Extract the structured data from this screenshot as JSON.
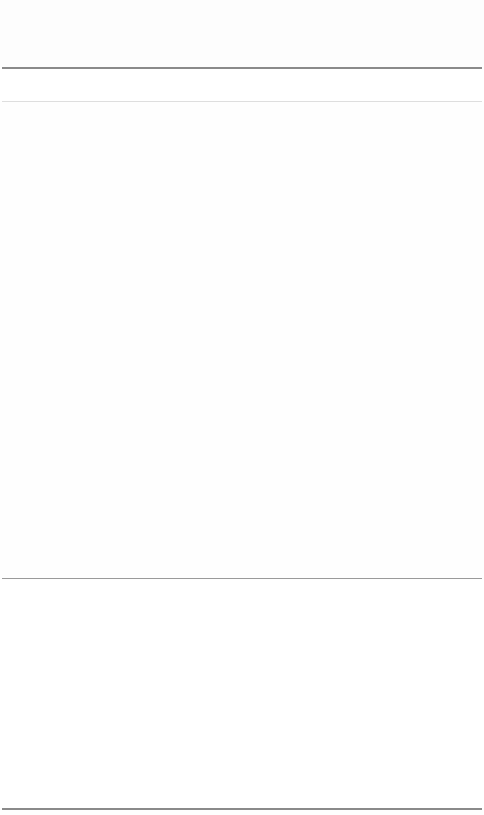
{
  "page": {
    "state": "blank",
    "background": "#ffffff"
  },
  "header": {
    "title": ""
  },
  "toolbar": {
    "label": ""
  },
  "content": {
    "text": ""
  },
  "footer": {
    "text": ""
  },
  "colors": {
    "divider_strong": "#8a8a8a",
    "divider_light": "#dedede"
  }
}
